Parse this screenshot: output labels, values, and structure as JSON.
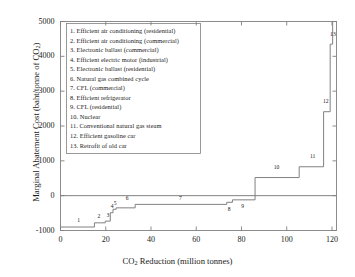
{
  "chart_data": {
    "type": "line",
    "subtype": "step-marginal-abatement-cost-curve",
    "title": "",
    "xlabel": "CO2 Reduction (million tonnes)",
    "ylabel": "Marginal Abatement Cost (baht/tonne of CO2)",
    "xlim": [
      0,
      122
    ],
    "ylim": [
      -1000,
      5000
    ],
    "xticks": [
      0,
      20,
      40,
      60,
      80,
      100,
      120
    ],
    "yticks": [
      -1000,
      0,
      1000,
      2000,
      3000,
      4000,
      5000
    ],
    "grid": false,
    "legend_position": "inside-top-left",
    "zero_line": 0,
    "axis_color": "#808080",
    "line_color": "#808080",
    "steps": [
      {
        "id": 1,
        "label": "1",
        "x_start": 0,
        "x_end": 15.0,
        "cost": -900,
        "label_x": 8.0,
        "label_y": -720
      },
      {
        "id": 2,
        "label": "2",
        "x_start": 15.0,
        "x_end": 19.8,
        "cost": -780,
        "label_x": 17.0,
        "label_y": -600
      },
      {
        "id": 3,
        "label": "3",
        "x_start": 19.8,
        "x_end": 22.0,
        "cost": -730,
        "label_x": 21.0,
        "label_y": -580
      },
      {
        "id": 4,
        "label": "4",
        "x_start": 22.0,
        "x_end": 23.2,
        "cost": -490,
        "label_x": 22.8,
        "label_y": -330
      },
      {
        "id": 5,
        "label": "5",
        "x_start": 23.2,
        "x_end": 24.6,
        "cost": -390,
        "label_x": 24.2,
        "label_y": -240
      },
      {
        "id": 6,
        "label": "6",
        "x_start": 24.6,
        "x_end": 33.0,
        "cost": -350,
        "label_x": 29.5,
        "label_y": -90
      },
      {
        "id": 7,
        "label": "7",
        "x_start": 33.0,
        "x_end": 73.5,
        "cost": -250,
        "label_x": 53.0,
        "label_y": -90
      },
      {
        "id": 8,
        "label": "8",
        "x_start": 73.5,
        "x_end": 76.0,
        "cost": -190,
        "label_x": 74.6,
        "label_y": -400
      },
      {
        "id": 9,
        "label": "9",
        "x_start": 76.0,
        "x_end": 86.0,
        "cost": -120,
        "label_x": 80.5,
        "label_y": -330
      },
      {
        "id": 10,
        "label": "10",
        "x_start": 86.0,
        "x_end": 105.5,
        "cost": 520,
        "label_x": 95.5,
        "label_y": 790
      },
      {
        "id": 11,
        "label": "11",
        "x_start": 105.5,
        "x_end": 116.3,
        "cost": 830,
        "label_x": 111.5,
        "label_y": 1110
      },
      {
        "id": 12,
        "label": "12",
        "x_start": 116.3,
        "x_end": 119.2,
        "cost": 2410,
        "label_x": 117.3,
        "label_y": 2690
      },
      {
        "id": 13,
        "label": "13",
        "x_start": 119.2,
        "x_end": 120.3,
        "cost": 4350,
        "label_x": 120.4,
        "label_y": 4600
      }
    ]
  },
  "legend": {
    "entries": [
      "1. Efficient air conditioning (residential)",
      "2. Efficient air conditioning (commercial)",
      "3. Electronic ballast (commercial)",
      "4. Efficient electric motor (industrial)",
      "5. Electronic ballast (residential)",
      "6. Natural gas combined cycle",
      "7. CFL (commercial)",
      "8. Efficient refrigerator",
      "9. CFL (residential)",
      "10. Nuclear",
      "11. Conventional natural gas steam",
      "12. Efficient gasoline car",
      "13. Retrofit of old car"
    ]
  },
  "axes": {
    "y_title_prefix": "Marginal Abatement Cost (baht/tonne of CO",
    "y_title_sub": "2",
    "y_title_suffix": ")",
    "x_title_prefix": "CO",
    "x_title_sub": "2",
    "x_title_suffix": " Reduction (million tonnes)",
    "ytick_labels": [
      "5000",
      "4000",
      "3000",
      "2000",
      "1000",
      "0",
      "-1000"
    ],
    "xtick_labels": [
      "0",
      "20",
      "40",
      "60",
      "80",
      "100",
      "120"
    ]
  }
}
